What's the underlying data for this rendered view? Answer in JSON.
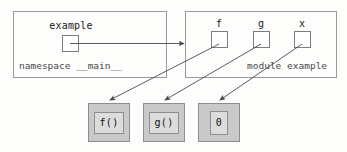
{
  "diagram": {
    "colors": {
      "box_border": "#9a9a9a",
      "slot_border": "#7d7d7d",
      "value_fill": "#c9c9c9",
      "value_inner_fill": "#dcdcdc",
      "arrow": "#4a4a4a",
      "text": "#1a1a1a",
      "caption_text": "#4a4a4a",
      "background": "#fdfdfc"
    },
    "namespace": {
      "caption": "namespace __main__",
      "slots": [
        {
          "label": "example",
          "slot_name": "example-slot"
        }
      ]
    },
    "module": {
      "caption": "module example",
      "slots": [
        {
          "label": "f"
        },
        {
          "label": "g"
        },
        {
          "label": "x"
        }
      ]
    },
    "values": [
      {
        "text": "f()"
      },
      {
        "text": "g()"
      },
      {
        "text": "0"
      }
    ],
    "arrows": [
      {
        "name": "arrow-example-to-module",
        "from": "example-slot",
        "to": "module-box"
      },
      {
        "name": "arrow-f-to-value-f",
        "from": "slot-f",
        "to": "value-box-f"
      },
      {
        "name": "arrow-g-to-value-g",
        "from": "slot-g",
        "to": "value-box-g"
      },
      {
        "name": "arrow-x-to-value-0",
        "from": "slot-x",
        "to": "value-box-0"
      }
    ]
  }
}
